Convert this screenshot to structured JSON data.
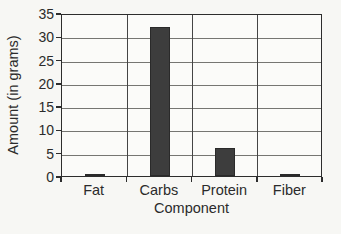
{
  "chart_data": {
    "type": "bar",
    "categories": [
      "Fat",
      "Carbs",
      "Protein",
      "Fiber"
    ],
    "values": [
      0.5,
      32,
      6,
      0.5
    ],
    "title": "",
    "xlabel": "Component",
    "ylabel": "Amount (in grams)",
    "ylim": [
      0,
      35
    ],
    "yticks": [
      0,
      5,
      10,
      15,
      20,
      25,
      30,
      35
    ],
    "grid": true,
    "legend": false,
    "legend_position": "none",
    "bar_color": "#3d3d3d"
  },
  "colors": {
    "background": "#f7f7f4",
    "plot_background": "#fbfbf9",
    "plot_border": "#2d2d2d",
    "grid_horizontal": "#767672",
    "grid_vertical": "#454545",
    "bar": "#3d3d3d",
    "text": "#2b2b2b"
  }
}
